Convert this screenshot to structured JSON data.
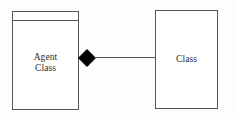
{
  "diagram": {
    "background_color": "#fdfdfd",
    "stroke_color": "#55555a",
    "text_color": "#2a2a2e",
    "nodes": [
      {
        "id": "agent-class",
        "label": "Agent\nClass",
        "label_line_1": "Agent",
        "label_line_2": "Class",
        "shape": "uml-class-box",
        "has_empty_top_compartment": true,
        "x": 12,
        "y": 11,
        "width": 67,
        "height": 99
      },
      {
        "id": "class",
        "label": "Class",
        "shape": "rectangle",
        "has_empty_top_compartment": false,
        "x": 155,
        "y": 10,
        "width": 63,
        "height": 99
      }
    ],
    "connector": {
      "type": "composition",
      "source": "agent-class",
      "target": "class",
      "diamond_filled": true,
      "diamond_color": "#000000",
      "line_color": "#55555a",
      "line_y": 58,
      "line_from_x": 94,
      "line_to_x": 156
    }
  }
}
